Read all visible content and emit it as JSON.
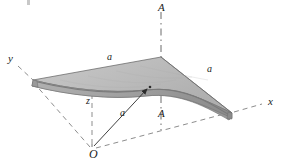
{
  "figure": {
    "type": "3d-technical-diagram",
    "background_color": "#ffffff",
    "ink_color": "#1a1a1a"
  },
  "axes": [
    {
      "id": "y",
      "label": "y",
      "x": 8,
      "y": 60,
      "style": "dashed"
    },
    {
      "id": "x",
      "label": "x",
      "x": 268,
      "y": 103,
      "style": "dashed"
    },
    {
      "id": "z",
      "label": "z",
      "x": 86,
      "y": 98,
      "style": "dashed"
    }
  ],
  "origin": {
    "label": "O",
    "x": 92,
    "y": 150
  },
  "section_line": {
    "label_top": "A",
    "label_bottom": "A",
    "top": {
      "x": 161,
      "y": 4
    },
    "bottom": {
      "x": 161,
      "y": 110
    },
    "style": "dash-dot"
  },
  "dimensions": [
    {
      "label": "a",
      "role": "edge-left-top",
      "x": 107,
      "y": 54
    },
    {
      "label": "a",
      "role": "edge-right",
      "x": 207,
      "y": 66
    },
    {
      "label": "a",
      "role": "rise-from-origin",
      "x": 120,
      "y": 108
    }
  ],
  "surface": {
    "kind": "hyperbolic-paraboloid-shell",
    "top_face_color": "#bfbfbf",
    "shadow_face_color": "#8f8f8f",
    "edge_thickness_color": "#a6a6a6",
    "outline_color": "#5a5a5a"
  },
  "leader": {
    "from": {
      "x": 93,
      "y": 147
    },
    "to": {
      "x": 150,
      "y": 87
    },
    "arrow": true
  },
  "plan_outline": {
    "style": "dashed",
    "corners": [
      {
        "x": 92,
        "y": 148
      },
      {
        "x": 33,
        "y": 80
      },
      {
        "x": 232,
        "y": 113
      }
    ]
  },
  "colors": {
    "light_gray": "#c4c4c4",
    "mid_gray": "#a0a0a0",
    "dark_gray": "#7d7d7d",
    "line": "#333333",
    "dash": "#8a8a8a"
  }
}
